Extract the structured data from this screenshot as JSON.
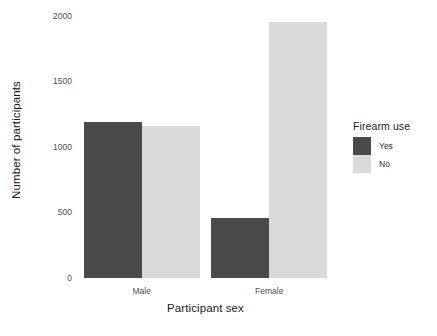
{
  "chart_data": {
    "type": "bar",
    "title": "",
    "subtitle": "",
    "xlabel": "Participant sex",
    "ylabel": "Number of participants",
    "categories": [
      "Male",
      "Female"
    ],
    "series": [
      {
        "name": "Yes",
        "values": [
          1190,
          460
        ],
        "color": "#4a4a4a"
      },
      {
        "name": "No",
        "values": [
          1160,
          1950
        ],
        "color": "#d9d9d9"
      }
    ],
    "legend": {
      "title": "Firearm use",
      "position": "right",
      "entries": [
        {
          "label": "Yes",
          "color": "#4a4a4a"
        },
        {
          "label": "No",
          "color": "#d9d9d9"
        }
      ]
    },
    "yaxis": {
      "ticks": [
        0,
        500,
        1000,
        1500,
        2000
      ],
      "tick_labels": [
        "0",
        "500",
        "1000",
        "1500",
        "2000"
      ],
      "ylim": [
        0,
        2060
      ]
    },
    "xaxis": {
      "tick_labels": [
        "Male",
        "Female"
      ]
    },
    "grid": false,
    "background": "#ffffff",
    "bar_mode": "dodge"
  }
}
